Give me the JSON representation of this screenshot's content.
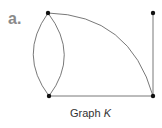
{
  "figure": {
    "part_label": "a.",
    "caption_prefix": "Graph ",
    "caption_var": "K",
    "colors": {
      "edge": "#555555",
      "vertex": "#111111",
      "label": "#8a8a8a"
    }
  },
  "graph": {
    "vertices": [
      {
        "id": "TL",
        "x": 48,
        "y": 13
      },
      {
        "id": "TR",
        "x": 153,
        "y": 13
      },
      {
        "id": "BL",
        "x": 49,
        "y": 96
      },
      {
        "id": "BR",
        "x": 153,
        "y": 96
      }
    ],
    "edges": [
      {
        "from": "TL",
        "to": "BL",
        "type": "curve-left"
      },
      {
        "from": "TL",
        "to": "BL",
        "type": "curve-right"
      },
      {
        "from": "TL",
        "to": "BR",
        "type": "arc"
      },
      {
        "from": "BL",
        "to": "BR",
        "type": "straight"
      },
      {
        "from": "TR",
        "to": "BR",
        "type": "straight"
      }
    ]
  }
}
